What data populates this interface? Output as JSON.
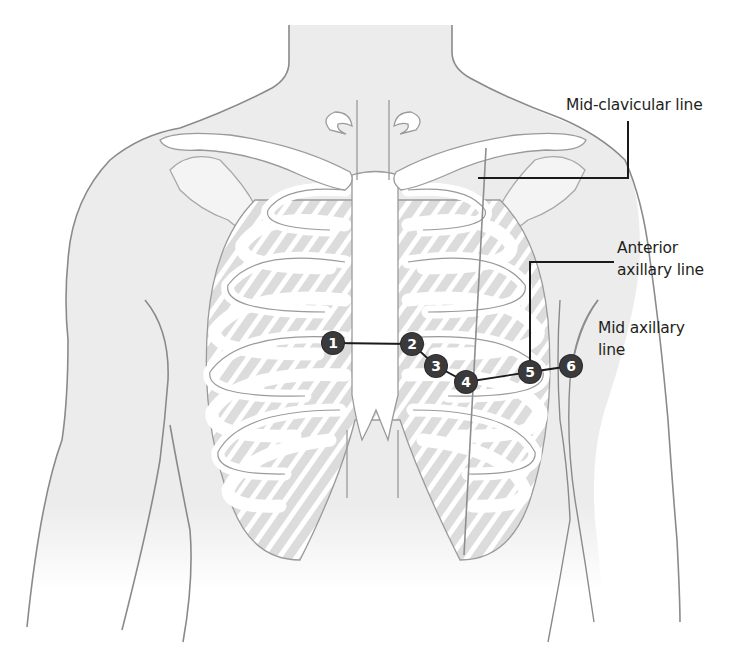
{
  "figure": {
    "colors": {
      "background": "#ffffff",
      "skin_fill": "#ececec",
      "outline": "#8a8a8a",
      "bone_fill": "#ffffff",
      "intercostal_fill": "#dcdcdc",
      "leader_line": "#1a1a1a",
      "marker_fill": "#3a3a3c",
      "marker_text": "#ffffff",
      "label_text": "#231f20"
    }
  },
  "labels": {
    "mid_clavicular": "Mid-clavicular line",
    "anterior_axillary_line1": "Anterior",
    "anterior_axillary_line2": "axillary line",
    "mid_axillary_line1": "Mid axillary",
    "mid_axillary_line2": "line"
  },
  "electrodes": [
    {
      "id": "1",
      "x": 333,
      "y": 343
    },
    {
      "id": "2",
      "x": 412,
      "y": 344
    },
    {
      "id": "3",
      "x": 436,
      "y": 366
    },
    {
      "id": "4",
      "x": 466,
      "y": 382
    },
    {
      "id": "5",
      "x": 530,
      "y": 372
    },
    {
      "id": "6",
      "x": 571,
      "y": 366
    }
  ]
}
